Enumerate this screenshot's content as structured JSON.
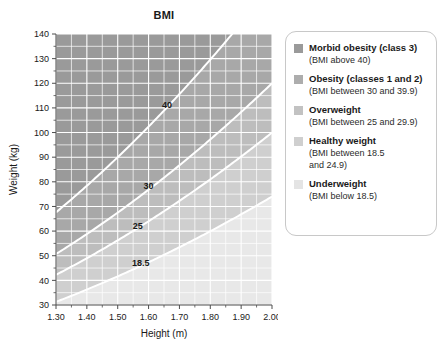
{
  "chart_data": {
    "type": "line",
    "title": "BMI",
    "xlabel": "Height (m)",
    "ylabel": "Weight (kg)",
    "xlim": [
      1.3,
      2.0
    ],
    "ylim": [
      30,
      140
    ],
    "grid": true,
    "x_ticks": [
      "1.30",
      "1.40",
      "1.50",
      "1.60",
      "1.70",
      "1.80",
      "1.90",
      "2.00"
    ],
    "x_tick_values": [
      1.3,
      1.4,
      1.5,
      1.6,
      1.7,
      1.8,
      1.9,
      2.0
    ],
    "y_ticks": [
      "30",
      "40",
      "50",
      "60",
      "70",
      "80",
      "90",
      "100",
      "110",
      "120",
      "130",
      "140"
    ],
    "y_tick_values": [
      30,
      40,
      50,
      60,
      70,
      80,
      90,
      100,
      110,
      120,
      130,
      140
    ],
    "x_minor_step": 0.05,
    "y_minor_step": 5,
    "series": [
      {
        "name": "40",
        "bmi": 40,
        "label": "40",
        "label_x": 1.66,
        "label_y": 110
      },
      {
        "name": "30",
        "bmi": 30,
        "label": "30",
        "label_x": 1.6,
        "label_y": 77
      },
      {
        "name": "25",
        "bmi": 25,
        "label": "25",
        "label_x": 1.565,
        "label_y": 61
      },
      {
        "name": "18.5",
        "bmi": 18.5,
        "label": "18.5",
        "label_x": 1.575,
        "label_y": 46
      }
    ],
    "bands": [
      {
        "name": "morbid-obesity",
        "min_bmi": 40,
        "max_bmi": 999,
        "color": "#9a9a9a"
      },
      {
        "name": "obesity",
        "min_bmi": 30,
        "max_bmi": 40,
        "color": "#a8a8a8"
      },
      {
        "name": "overweight",
        "min_bmi": 25,
        "max_bmi": 30,
        "color": "#bdbdbd"
      },
      {
        "name": "healthy-weight",
        "min_bmi": 18.5,
        "max_bmi": 25,
        "color": "#cfcfcf"
      },
      {
        "name": "underweight",
        "min_bmi": 0,
        "max_bmi": 18.5,
        "color": "#e8e8e8"
      }
    ],
    "curve_color": "#ffffff",
    "gridline_color": "#ffffff",
    "axis_color": "#4d4d4d"
  },
  "legend": {
    "entries": [
      {
        "label": "Morbid obesity (class 3)",
        "desc_lines": [
          "(BMI above 40)"
        ],
        "swatch_color": "#9a9a9a"
      },
      {
        "label": "Obesity (classes 1 and 2)",
        "desc_lines": [
          "(BMI between 30 and 39.9)"
        ],
        "swatch_color": "#adadad"
      },
      {
        "label": "Overweight",
        "desc_lines": [
          "(BMI between 25 and 29.9)"
        ],
        "swatch_color": "#c2c2c2"
      },
      {
        "label": "Healthy weight",
        "desc_lines": [
          "(BMI between 18.5",
          "and 24.9)"
        ],
        "swatch_color": "#cfcfcf"
      },
      {
        "label": "Underweight",
        "desc_lines": [
          "(BMI below 18.5)"
        ],
        "swatch_color": "#e4e4e4"
      }
    ]
  }
}
